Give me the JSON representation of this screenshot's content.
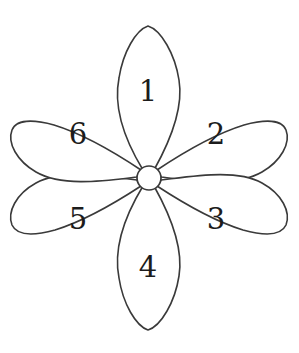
{
  "figure": {
    "background_color": "#ffffff",
    "stroke_color": "#3a3a3a",
    "text_color": "#1c1c1c",
    "width": 299,
    "height": 353
  },
  "flower": {
    "center": {
      "x": 149,
      "y": 178,
      "radius": 12
    },
    "petal_count": 6,
    "petals": [
      {
        "label": "1",
        "position": "top",
        "angle_deg": 270,
        "shape": "narrow-pointed",
        "label_x": 148,
        "label_y": 92,
        "tip_x": 148,
        "tip_y": 26
      },
      {
        "label": "2",
        "position": "upper-right",
        "angle_deg": 330,
        "shape": "wide-blunt",
        "label_x": 216,
        "label_y": 135,
        "tip_x": 274,
        "tip_y": 102
      },
      {
        "label": "3",
        "position": "lower-right",
        "angle_deg": 30,
        "shape": "wide-blunt",
        "label_x": 216,
        "label_y": 220,
        "tip_x": 274,
        "tip_y": 252
      },
      {
        "label": "4",
        "position": "bottom",
        "angle_deg": 90,
        "shape": "narrow-pointed",
        "label_x": 148,
        "label_y": 268,
        "tip_x": 148,
        "tip_y": 329
      },
      {
        "label": "5",
        "position": "lower-left",
        "angle_deg": 150,
        "shape": "wide-blunt",
        "label_x": 78,
        "label_y": 220,
        "tip_x": 24,
        "tip_y": 252
      },
      {
        "label": "6",
        "position": "upper-left",
        "angle_deg": 210,
        "shape": "wide-blunt",
        "label_x": 78,
        "label_y": 135,
        "tip_x": 24,
        "tip_y": 102
      }
    ]
  }
}
